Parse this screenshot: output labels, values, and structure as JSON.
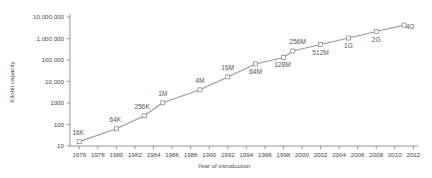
{
  "chart_data": {
    "type": "line",
    "title": "",
    "subtitle": "",
    "xlabel": "Year of introduction",
    "ylabel": "Kilobit capacity",
    "yscale": "log",
    "ylim": [
      10,
      10000000
    ],
    "xlim": [
      1975,
      2012.5
    ],
    "grid": false,
    "legend": null,
    "y_ticks": [
      {
        "value": 10000000,
        "label": "10,000,000"
      },
      {
        "value": 1000000,
        "label": "1,000,000"
      },
      {
        "value": 100000,
        "label": "100,000"
      },
      {
        "value": 10000,
        "label": "10,000"
      },
      {
        "value": 1000,
        "label": "1000"
      },
      {
        "value": 100,
        "label": "100"
      },
      {
        "value": 10,
        "label": "10"
      }
    ],
    "x_ticks": [
      {
        "value": 1976,
        "label": "1976"
      },
      {
        "value": 1978,
        "label": "1978"
      },
      {
        "value": 1980,
        "label": "1980"
      },
      {
        "value": 1982,
        "label": "1982"
      },
      {
        "value": 1984,
        "label": "1984"
      },
      {
        "value": 1986,
        "label": "1986"
      },
      {
        "value": 1988,
        "label": "1988"
      },
      {
        "value": 1990,
        "label": "1990"
      },
      {
        "value": 1992,
        "label": "1992"
      },
      {
        "value": 1994,
        "label": "1994"
      },
      {
        "value": 1996,
        "label": "1996"
      },
      {
        "value": 1998,
        "label": "1998"
      },
      {
        "value": 2000,
        "label": "2000"
      },
      {
        "value": 2002,
        "label": "2002"
      },
      {
        "value": 2004,
        "label": "2004"
      },
      {
        "value": 2006,
        "label": "2006"
      },
      {
        "value": 2008,
        "label": "2008"
      },
      {
        "value": 2010,
        "label": "2010"
      },
      {
        "value": 2012,
        "label": "2012"
      }
    ],
    "points": [
      {
        "x": 1976,
        "y": 16,
        "label": "16K",
        "label_dx": -1,
        "label_dy": -7
      },
      {
        "x": 1980,
        "y": 64,
        "label": "64K",
        "label_dx": -1,
        "label_dy": -7
      },
      {
        "x": 1983,
        "y": 256,
        "label": "256K",
        "label_dx": -2,
        "label_dy": -7
      },
      {
        "x": 1985,
        "y": 1024,
        "label": "1M",
        "label_dx": 0,
        "label_dy": -7
      },
      {
        "x": 1989,
        "y": 4096,
        "label": "4M",
        "label_dx": 0,
        "label_dy": -7
      },
      {
        "x": 1992,
        "y": 16384,
        "label": "16M",
        "label_dx": 0,
        "label_dy": -7
      },
      {
        "x": 1995,
        "y": 65536,
        "label": "64M",
        "label_dx": 0,
        "label_dy": 10
      },
      {
        "x": 1998,
        "y": 131072,
        "label": "128M",
        "label_dx": -1,
        "label_dy": 10
      },
      {
        "x": 1999,
        "y": 262144,
        "label": "256M",
        "label_dx": 5,
        "label_dy": -7
      },
      {
        "x": 2002,
        "y": 524288,
        "label": "512M",
        "label_dx": 0,
        "label_dy": 10
      },
      {
        "x": 2005,
        "y": 1048576,
        "label": "1G",
        "label_dx": 0,
        "label_dy": 10
      },
      {
        "x": 2008,
        "y": 2097152,
        "label": "2G",
        "label_dx": 0,
        "label_dy": 10
      },
      {
        "x": 2011,
        "y": 4194304,
        "label": "4G",
        "label_dx": 6,
        "label_dy": 4
      }
    ]
  },
  "colors": {
    "line": "#9a9a9a",
    "marker_fill": "#ffffff",
    "marker_stroke": "#8f8f8f",
    "axis": "#8a8a8a",
    "text": "#4a4a4a",
    "background": "#ffffff"
  }
}
